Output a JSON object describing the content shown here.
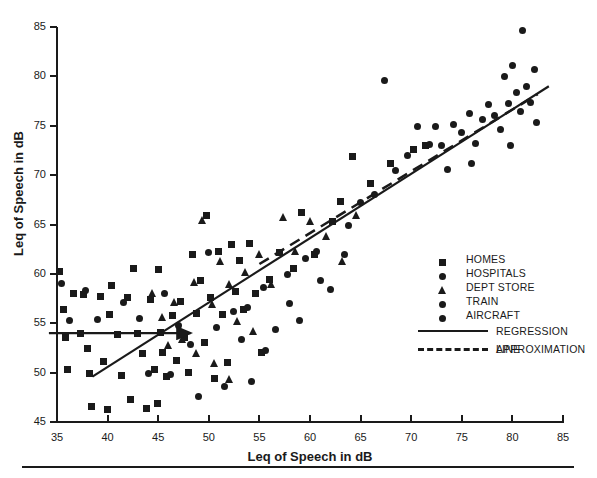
{
  "chart_data": {
    "type": "scatter",
    "title": "",
    "xlabel": "Leq of Speech in dB",
    "ylabel": "Leq of Speech in dB",
    "xlim": [
      35,
      85
    ],
    "ylim": [
      45,
      85
    ],
    "xticks": [
      35,
      40,
      45,
      50,
      55,
      60,
      65,
      70,
      75,
      80,
      85
    ],
    "yticks": [
      45,
      50,
      55,
      60,
      65,
      70,
      75,
      80,
      85
    ],
    "grid": false,
    "legend_position": "center-right",
    "legend_entries": [
      {
        "label": "HOMES",
        "marker": "square"
      },
      {
        "label": "HOSPITALS",
        "marker": "circle"
      },
      {
        "label": "DEPT STORE",
        "marker": "triangle"
      },
      {
        "label": "TRAIN",
        "marker": "circle"
      },
      {
        "label": "AIRCRAFT",
        "marker": "circle"
      },
      {
        "label": "REGRESSION LINE",
        "marker": "solid-line"
      },
      {
        "label": "APPROXIMATION",
        "marker": "dashed-line"
      }
    ],
    "series": [
      {
        "name": "HOMES",
        "marker": "square",
        "points": [
          [
            35.2,
            60.2
          ],
          [
            35.6,
            56.4
          ],
          [
            35.8,
            53.6
          ],
          [
            36.0,
            50.3
          ],
          [
            36.6,
            58.0
          ],
          [
            37.3,
            54.0
          ],
          [
            37.6,
            57.9
          ],
          [
            38.0,
            52.4
          ],
          [
            38.2,
            49.9
          ],
          [
            38.4,
            46.6
          ],
          [
            39.3,
            57.7
          ],
          [
            39.6,
            51.1
          ],
          [
            40.0,
            46.3
          ],
          [
            40.2,
            55.9
          ],
          [
            40.4,
            58.8
          ],
          [
            41.0,
            53.9
          ],
          [
            41.4,
            49.7
          ],
          [
            42.0,
            57.6
          ],
          [
            42.3,
            47.3
          ],
          [
            42.6,
            60.5
          ],
          [
            43.0,
            54.0
          ],
          [
            43.4,
            51.9
          ],
          [
            43.8,
            46.4
          ],
          [
            44.2,
            57.4
          ],
          [
            44.6,
            50.3
          ],
          [
            44.9,
            46.9
          ],
          [
            45.0,
            60.4
          ],
          [
            45.2,
            54.1
          ],
          [
            45.4,
            52.0
          ],
          [
            45.8,
            49.6
          ],
          [
            46.4,
            55.8
          ],
          [
            46.8,
            51.2
          ],
          [
            47.2,
            57.2
          ],
          [
            47.6,
            53.6
          ],
          [
            48.0,
            50.0
          ],
          [
            48.4,
            62.0
          ],
          [
            48.8,
            56.0
          ],
          [
            49.2,
            59.3
          ],
          [
            49.6,
            53.1
          ],
          [
            49.8,
            65.9
          ],
          [
            50.2,
            57.6
          ],
          [
            50.6,
            49.4
          ],
          [
            51.0,
            62.3
          ],
          [
            51.4,
            55.9
          ],
          [
            51.8,
            51.0
          ],
          [
            52.2,
            63.0
          ],
          [
            52.6,
            58.2
          ],
          [
            53.0,
            61.4
          ],
          [
            53.4,
            56.4
          ],
          [
            54.0,
            63.1
          ],
          [
            54.6,
            58.0
          ],
          [
            55.2,
            52.0
          ],
          [
            56.0,
            59.4
          ],
          [
            57.0,
            62.2
          ],
          [
            58.4,
            60.5
          ],
          [
            59.2,
            66.2
          ],
          [
            60.4,
            62.0
          ],
          [
            62.2,
            65.3
          ],
          [
            63.0,
            67.3
          ],
          [
            64.2,
            71.9
          ],
          [
            66.0,
            69.2
          ],
          [
            68.0,
            71.2
          ],
          [
            70.2,
            72.6
          ],
          [
            71.4,
            73.0
          ]
        ]
      },
      {
        "name": "HOSPITALS",
        "marker": "circle",
        "points": [
          [
            35.4,
            59.0
          ],
          [
            36.2,
            55.3
          ],
          [
            37.8,
            58.3
          ],
          [
            39.0,
            55.4
          ],
          [
            41.6,
            57.1
          ],
          [
            43.2,
            55.5
          ],
          [
            44.0,
            49.9
          ],
          [
            45.6,
            58.0
          ],
          [
            46.2,
            49.8
          ],
          [
            47.0,
            54.8
          ],
          [
            48.2,
            52.8
          ],
          [
            49.0,
            47.6
          ],
          [
            50.0,
            62.2
          ],
          [
            50.8,
            54.6
          ],
          [
            51.6,
            48.6
          ],
          [
            52.4,
            56.2
          ],
          [
            53.2,
            53.4
          ],
          [
            54.2,
            49.1
          ],
          [
            55.4,
            58.6
          ],
          [
            56.6,
            54.4
          ],
          [
            58.0,
            57.0
          ],
          [
            59.6,
            61.6
          ],
          [
            61.0,
            59.3
          ],
          [
            63.4,
            62.0
          ]
        ]
      },
      {
        "name": "DEPT STORE",
        "marker": "triangle",
        "points": [
          [
            44.4,
            58.1
          ],
          [
            45.4,
            55.6
          ],
          [
            46.6,
            57.2
          ],
          [
            47.4,
            53.4
          ],
          [
            48.6,
            59.2
          ],
          [
            49.4,
            65.5
          ],
          [
            50.4,
            57.0
          ],
          [
            51.2,
            61.3
          ],
          [
            52.0,
            59.0
          ],
          [
            52.8,
            55.2
          ],
          [
            53.6,
            60.2
          ],
          [
            54.4,
            54.2
          ],
          [
            55.0,
            62.0
          ],
          [
            56.2,
            59.0
          ],
          [
            57.4,
            65.8
          ],
          [
            58.6,
            62.3
          ],
          [
            60.0,
            65.4
          ],
          [
            61.6,
            63.8
          ],
          [
            63.2,
            61.3
          ],
          [
            64.6,
            66.0
          ],
          [
            48.8,
            52.0
          ],
          [
            50.6,
            51.0
          ],
          [
            52.0,
            49.4
          ],
          [
            46.0,
            52.8
          ]
        ]
      },
      {
        "name": "TRAIN",
        "marker": "circle",
        "points": [
          [
            53.8,
            56.6
          ],
          [
            55.6,
            52.2
          ],
          [
            57.8,
            59.9
          ],
          [
            59.0,
            55.3
          ],
          [
            60.6,
            62.3
          ],
          [
            62.0,
            58.4
          ],
          [
            63.8,
            64.9
          ],
          [
            65.0,
            67.2
          ],
          [
            66.4,
            68.0
          ],
          [
            67.4,
            79.6
          ],
          [
            68.4,
            70.5
          ],
          [
            69.6,
            72.0
          ],
          [
            70.6,
            74.9
          ],
          [
            71.8,
            73.1
          ]
        ]
      },
      {
        "name": "AIRCRAFT",
        "marker": "circle",
        "points": [
          [
            72.4,
            74.9
          ],
          [
            73.0,
            73.0
          ],
          [
            74.2,
            75.1
          ],
          [
            75.0,
            74.3
          ],
          [
            75.8,
            76.2
          ],
          [
            76.4,
            73.2
          ],
          [
            77.0,
            75.6
          ],
          [
            77.6,
            77.2
          ],
          [
            78.2,
            76.0
          ],
          [
            78.8,
            74.6
          ],
          [
            79.2,
            80.0
          ],
          [
            79.6,
            77.3
          ],
          [
            80.0,
            81.1
          ],
          [
            80.4,
            78.4
          ],
          [
            80.8,
            76.4
          ],
          [
            81.0,
            84.6
          ],
          [
            81.4,
            79.0
          ],
          [
            81.8,
            77.4
          ],
          [
            82.2,
            80.7
          ],
          [
            82.4,
            75.3
          ],
          [
            73.6,
            70.6
          ],
          [
            76.0,
            71.2
          ],
          [
            79.8,
            73.0
          ]
        ]
      }
    ],
    "regression_line": {
      "x0": 38.5,
      "y0": 49.6,
      "x1": 83.6,
      "y1": 79.0
    },
    "approximation_line": {
      "x0": 55.0,
      "y0": 61.0,
      "x1": 82.5,
      "y1": 78.2
    },
    "reference_arrow": {
      "x0": 34.2,
      "y0": 54.0,
      "x1": 48.2,
      "y1": 54.0
    }
  }
}
